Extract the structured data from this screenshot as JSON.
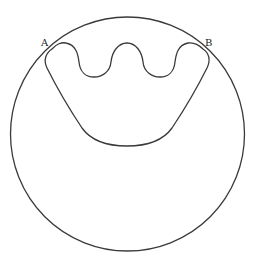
{
  "diagram": {
    "type": "geometry-figure",
    "labels": {
      "point_a": "A",
      "point_b": "B"
    },
    "colors": {
      "stroke": "#3a3a3a",
      "background": "#ffffff",
      "label": "#222222"
    },
    "outer_circle": {
      "cx": 127.5,
      "cy": 134,
      "r": 117
    },
    "points": {
      "A": {
        "x": 52,
        "y": 49
      },
      "B": {
        "x": 203,
        "y": 49
      }
    }
  }
}
